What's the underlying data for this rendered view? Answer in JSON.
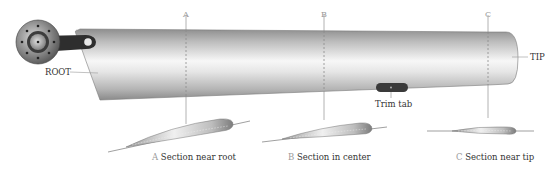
{
  "diagram": {
    "labels": {
      "root": "ROOT",
      "tip": "TIP",
      "trim_tab": "Trim tab"
    },
    "section_markers": [
      {
        "letter": "A",
        "x": 186
      },
      {
        "letter": "B",
        "x": 324
      },
      {
        "letter": "C",
        "x": 488
      }
    ],
    "sections": [
      {
        "letter": "A",
        "caption": "Section near root"
      },
      {
        "letter": "B",
        "caption": "Section in center"
      },
      {
        "letter": "C",
        "caption": "Section near tip"
      }
    ],
    "colors": {
      "blade_dark": "#8c8c8c",
      "blade_light": "#f4f4f4",
      "hub": "#6e6e6e",
      "arm": "#2e2e2e",
      "trim_tab": "#3a3a3a",
      "marker_line": "#9a9a9a",
      "label_text": "#333333"
    }
  }
}
